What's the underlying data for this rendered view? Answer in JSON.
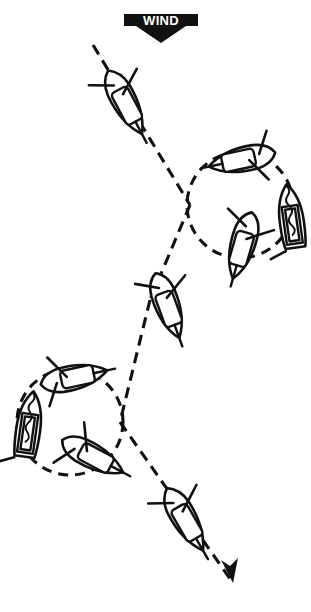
{
  "figure": {
    "wind_label": "WIND",
    "wind_direction": "from top of page, blowing downward",
    "accent_color": "#111111",
    "background_color": "#ffffff"
  },
  "wind_arrow": {
    "label": "WIND",
    "x": 124,
    "y": 10,
    "width": 74,
    "height": 33
  },
  "course": {
    "name": "main-course-track",
    "style": "dashed",
    "start": [
      93,
      45
    ],
    "end": [
      233,
      583
    ],
    "arrowhead_at": [
      233,
      583
    ]
  },
  "circles": [
    {
      "name": "upper-right-circle",
      "center": [
        240,
        205
      ],
      "radius": 53,
      "rotation": "clockwise"
    },
    {
      "name": "lower-left-circle",
      "center": [
        70,
        422
      ],
      "radius": 53,
      "rotation": "counter-clockwise"
    }
  ],
  "boats": [
    {
      "id": 1,
      "name": "boat-top-reaching",
      "x": 126,
      "y": 104,
      "heading_deg": 152,
      "view": "plan",
      "sail_state": "trimmed"
    },
    {
      "id": 2,
      "name": "boat-circle-upper-top",
      "x": 240,
      "y": 160,
      "heading_deg": 258,
      "view": "plan",
      "sail_state": "trimmed"
    },
    {
      "id": 3,
      "name": "boat-circle-upper-right",
      "x": 291,
      "y": 216,
      "heading_deg": 352,
      "view": "head-on",
      "sail_state": "luffing"
    },
    {
      "id": 4,
      "name": "boat-circle-upper-bottom",
      "x": 242,
      "y": 247,
      "heading_deg": 196,
      "view": "plan",
      "sail_state": "trimmed"
    },
    {
      "id": 5,
      "name": "boat-middle-running",
      "x": 168,
      "y": 307,
      "heading_deg": 160,
      "view": "plan",
      "sail_state": "trimmed"
    },
    {
      "id": 6,
      "name": "boat-circle-lower-top",
      "x": 76,
      "y": 377,
      "heading_deg": 78,
      "view": "plan",
      "sail_state": "trimmed"
    },
    {
      "id": 7,
      "name": "boat-circle-lower-left",
      "x": 29,
      "y": 424,
      "heading_deg": 8,
      "view": "head-on",
      "sail_state": "luffing"
    },
    {
      "id": 8,
      "name": "boat-circle-lower-bottom",
      "x": 94,
      "y": 457,
      "heading_deg": 118,
      "view": "plan",
      "sail_state": "trimmed"
    },
    {
      "id": 9,
      "name": "boat-bottom-reaching",
      "x": 186,
      "y": 521,
      "heading_deg": 150,
      "view": "plan",
      "sail_state": "trimmed"
    }
  ]
}
